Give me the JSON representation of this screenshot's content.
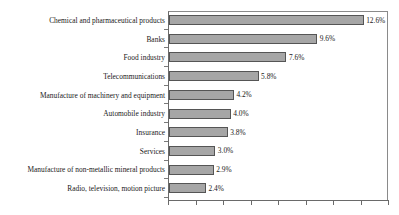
{
  "chart_data": {
    "type": "bar",
    "orientation": "horizontal",
    "title": "",
    "subtitle": "",
    "xlabel": "",
    "ylabel": "",
    "grid": false,
    "legend": null,
    "xlim": [
      0,
      14
    ],
    "x_tick_count": 8,
    "x_tick_labels": [],
    "value_suffix": "%",
    "categories": [
      "Chemical and pharmaceutical products",
      "Banks",
      "Food industry",
      "Telecommunications",
      "Manufacture of machinery and equipment",
      "Automobile industry",
      "Insurance",
      "Services",
      "Manufacture of non-metallic mineral products",
      "Radio, television, motion picture"
    ],
    "values": [
      12.6,
      9.6,
      7.6,
      5.8,
      4.2,
      4.0,
      3.8,
      3.0,
      2.9,
      2.4
    ],
    "value_labels": [
      "12.6%",
      "9.6%",
      "7.6%",
      "5.8%",
      "4.2%",
      "4.0%",
      "3.8%",
      "3.0%",
      "2.9%",
      "2.4%"
    ],
    "colors": {
      "bar_fill": "#a6a6a6",
      "bar_border": "#555555",
      "axis": "#6a6a6a",
      "text": "#1a1a1a",
      "background": "#ffffff"
    }
  }
}
